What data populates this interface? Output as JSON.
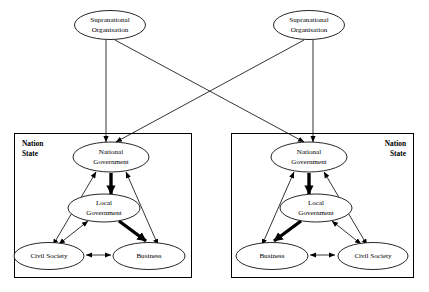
{
  "diagram": {
    "type": "node-link-diagram",
    "colors": {
      "background": "#ffffff",
      "stroke": "#000000",
      "node_fill": "#ffffff"
    },
    "supranational": [
      {
        "id": "supra-left",
        "label_line1": "Supranational",
        "label_line2": "Organisation"
      },
      {
        "id": "supra-right",
        "label_line1": "Supranational",
        "label_line2": "Organisation"
      }
    ],
    "nation_states": [
      {
        "id": "nation-state-left",
        "box_label_line1": "Nation",
        "box_label_line2": "State",
        "label_align": "left",
        "nodes": {
          "national_government_line1": "National",
          "national_government_line2": "Government",
          "local_government_line1": "Local",
          "local_government_line2": "Government",
          "bottom_left": "Civil Society",
          "bottom_right": "Business"
        }
      },
      {
        "id": "nation-state-right",
        "box_label_line1": "Nation",
        "box_label_line2": "State",
        "label_align": "right",
        "nodes": {
          "national_government_line1": "National",
          "national_government_line2": "Government",
          "local_government_line1": "Local",
          "local_government_line2": "Government",
          "bottom_left": "Business",
          "bottom_right": "Civil Society"
        }
      }
    ],
    "edges": [
      {
        "from": "supra-left",
        "to": "national-government-left",
        "style": "thin",
        "arrows": "single"
      },
      {
        "from": "supra-left",
        "to": "national-government-right",
        "style": "thin",
        "arrows": "single"
      },
      {
        "from": "supra-right",
        "to": "national-government-right",
        "style": "thin",
        "arrows": "single"
      },
      {
        "from": "supra-right",
        "to": "national-government-left",
        "style": "thin",
        "arrows": "single"
      },
      {
        "from": "national-government-left",
        "to": "local-government-left",
        "style": "thick",
        "arrows": "single"
      },
      {
        "from": "national-government-left",
        "to": "civil-society-left",
        "style": "thin",
        "arrows": "double"
      },
      {
        "from": "national-government-left",
        "to": "business-left",
        "style": "thin",
        "arrows": "double"
      },
      {
        "from": "local-government-left",
        "to": "civil-society-left",
        "style": "thin",
        "arrows": "double"
      },
      {
        "from": "local-government-left",
        "to": "business-left",
        "style": "thick",
        "arrows": "single"
      },
      {
        "from": "civil-society-left",
        "to": "business-left",
        "style": "thin",
        "arrows": "double"
      },
      {
        "from": "national-government-right",
        "to": "local-government-right",
        "style": "thick",
        "arrows": "single"
      },
      {
        "from": "national-government-right",
        "to": "civil-society-right",
        "style": "thin",
        "arrows": "double"
      },
      {
        "from": "national-government-right",
        "to": "business-right",
        "style": "thin",
        "arrows": "double"
      },
      {
        "from": "local-government-right",
        "to": "civil-society-right",
        "style": "thin",
        "arrows": "double"
      },
      {
        "from": "local-government-right",
        "to": "business-right",
        "style": "thick",
        "arrows": "single"
      },
      {
        "from": "business-right",
        "to": "civil-society-right",
        "style": "thin",
        "arrows": "double"
      }
    ]
  }
}
